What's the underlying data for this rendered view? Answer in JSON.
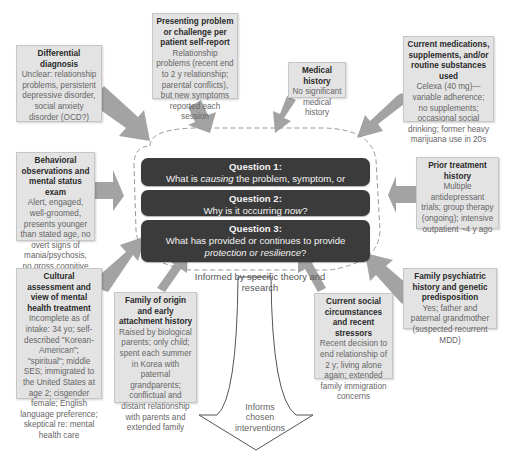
{
  "diagram": {
    "colors": {
      "box_fill": "#e3e3e3",
      "box_border": "#c6c6c6",
      "arrow_fill": "#a3a3a3",
      "question_fill": "#3b3b3b",
      "question_text": "#f2f2f2",
      "dashed_outline": "#9a9a9a"
    },
    "boxes": {
      "differential": {
        "title": "Differential diagnosis",
        "body": "Unclear: relationship problems, persistent depressive disorder, social anxiety disorder (OCD?)"
      },
      "presenting": {
        "title": "Presenting problem or challenge per patient self-report",
        "body": "Relationship problems (recent end to 2 y relationship; parental conflicts), but new symptoms reported each session"
      },
      "medical": {
        "title": "Medical history",
        "body": "No significant medical history"
      },
      "medications": {
        "title": "Current medications, supplements, and/or routine substances used",
        "body": "Celexa (40 mg)—variable adherence; no supplements; occasional social drinking; former heavy marijuana use in 20s"
      },
      "behavioral": {
        "title": "Behavioral observations and mental status exam",
        "body": "Alert, engaged, well-groomed, presents younger than stated age, no overt signs of mania/psychosis, no gross cognitive deficits"
      },
      "prior_treatment": {
        "title": "Prior treatment history",
        "body": "Multiple antidepressant trials; group therapy (ongoing); intensive outpatient ~4 y ago"
      },
      "cultural": {
        "title": "Cultural assessment and view of mental health treatment",
        "body": "Incomplete as of intake: 34 yo; self-described \"Korean-American\"; \"spiritual\"; middle SES; immigrated to the United States at age 2; cisgender female; English language preference; skeptical re: mental health care"
      },
      "family_origin": {
        "title": "Family of origin and early attachment history",
        "body": "Raised by biological parents; only child; spent each summer in Korea with paternal grandparents; conflictual and distant relationship with parents and extended family"
      },
      "social": {
        "title": "Current social circumstances and recent stressors",
        "body": "Recent decision to end relationship of 2 y; living alone again; extended family immigration concerns"
      },
      "family_psych": {
        "title": "Family psychiatric history and genetic predisposition",
        "body": "Yes; father and paternal grandmother (suspected recurrent MDD)"
      }
    },
    "questions": [
      {
        "title": "Question 1:",
        "pre": "What is ",
        "em": "causing",
        "post": " the problem, symptom, or challenge?"
      },
      {
        "title": "Question 2:",
        "pre": "Why is it occurring ",
        "em": "now",
        "post": "?"
      },
      {
        "title": "Question 3:",
        "pre": "What has provided or continues to provide ",
        "em": "protection or resilience",
        "post": "?"
      }
    ],
    "informed_by": "Informed by specific theory and research",
    "informs": "Informs chosen interventions"
  }
}
